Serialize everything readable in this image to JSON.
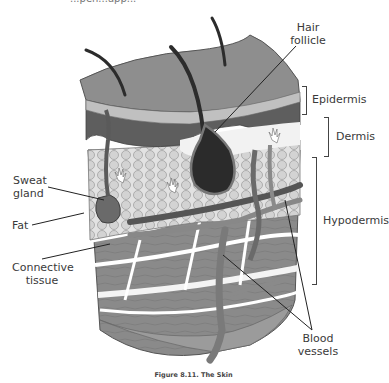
{
  "figure": {
    "caption": "Figure 8.11. The Skin",
    "top_fragment": "...pen...app..."
  },
  "labels": {
    "hair_follicle": [
      "Hair",
      "follicle"
    ],
    "epidermis": "Epidermis",
    "dermis": "Dermis",
    "hypodermis": "Hypodermis",
    "sweat_gland": [
      "Sweat",
      "gland"
    ],
    "fat": "Fat",
    "connective_tissue": [
      "Connective",
      "tissue"
    ],
    "blood_vessels": [
      "Blood",
      "vessels"
    ]
  },
  "colors": {
    "epidermis_top": "#8c8c8c",
    "epidermis_band": "#bdbdbd",
    "dermis_dark": "#5a5a5a",
    "fat_cells": "#d8d8d8",
    "connective": "#7a7a7a",
    "follicle": "#2b2b2b",
    "leader_line": "#222222",
    "text": "#3a3a3a"
  }
}
